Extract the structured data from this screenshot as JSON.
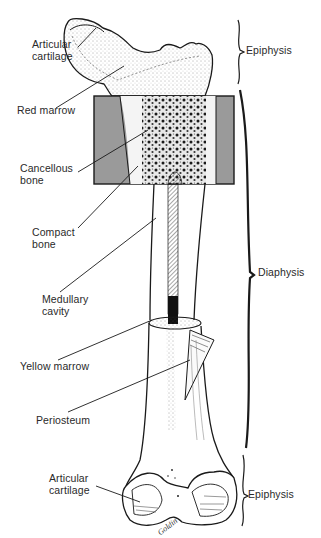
{
  "diagram": {
    "labels_left": [
      {
        "id": "articular-cartilage-top",
        "text": "Articular\ncartilage"
      },
      {
        "id": "red-marrow",
        "text": "Red marrow"
      },
      {
        "id": "cancellous-bone",
        "text": "Cancellous\nbone"
      },
      {
        "id": "compact-bone",
        "text": "Compact\nbone"
      },
      {
        "id": "medullary-cavity",
        "text": "Medullary\ncavity"
      },
      {
        "id": "yellow-marrow",
        "text": "Yellow marrow"
      },
      {
        "id": "periosteum",
        "text": "Periosteum"
      },
      {
        "id": "articular-cartilage-bottom",
        "text": "Articular\ncartilage"
      }
    ],
    "labels_right": [
      {
        "id": "epiphysis-top",
        "text": "Epiphysis"
      },
      {
        "id": "diaphysis",
        "text": "Diaphysis"
      },
      {
        "id": "epiphysis-bottom",
        "text": "Epiphysis"
      }
    ],
    "signature": "Goldin",
    "colors": {
      "line": "#1a1a1a",
      "section_gray": "#9a9a9a",
      "label_text": "#2a2a2a",
      "background": "#ffffff"
    }
  }
}
